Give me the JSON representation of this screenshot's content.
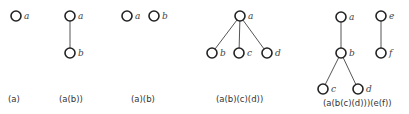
{
  "figure": {
    "node_radius": 5,
    "trees": [
      {
        "id": "t1",
        "caption": "(a)",
        "caption_pos": [
          8,
          102
        ],
        "nodes": [
          {
            "id": "a",
            "label": "a",
            "x": 16,
            "y": 16
          }
        ],
        "edges": []
      },
      {
        "id": "t2",
        "caption": "(a(b))",
        "caption_pos": [
          59,
          102
        ],
        "nodes": [
          {
            "id": "a",
            "label": "a",
            "x": 70,
            "y": 16
          },
          {
            "id": "b",
            "label": "b",
            "x": 70,
            "y": 53
          }
        ],
        "edges": [
          [
            "a",
            "b"
          ]
        ]
      },
      {
        "id": "t3",
        "caption": "(a)(b)",
        "caption_pos": [
          131,
          102
        ],
        "nodes": [
          {
            "id": "a",
            "label": "a",
            "x": 127,
            "y": 16
          },
          {
            "id": "b",
            "label": "b",
            "x": 154,
            "y": 16
          }
        ],
        "edges": []
      },
      {
        "id": "t4",
        "caption": "(a(b)(c)(d))",
        "caption_pos": [
          216,
          102
        ],
        "nodes": [
          {
            "id": "a",
            "label": "a",
            "x": 240,
            "y": 16
          },
          {
            "id": "b",
            "label": "b",
            "x": 212,
            "y": 53
          },
          {
            "id": "c",
            "label": "c",
            "x": 239,
            "y": 53
          },
          {
            "id": "d",
            "label": "d",
            "x": 267,
            "y": 53
          }
        ],
        "edges": [
          [
            "a",
            "b"
          ],
          [
            "a",
            "c"
          ],
          [
            "a",
            "d"
          ]
        ]
      },
      {
        "id": "t5",
        "caption": "(a(b(c)(d)))(e(f))",
        "caption_pos": [
          323,
          106
        ],
        "nodes": [
          {
            "id": "a",
            "label": "a",
            "x": 341,
            "y": 17
          },
          {
            "id": "b",
            "label": "b",
            "x": 341,
            "y": 53
          },
          {
            "id": "c",
            "label": "c",
            "x": 323,
            "y": 89
          },
          {
            "id": "d",
            "label": "d",
            "x": 358,
            "y": 89
          },
          {
            "id": "e",
            "label": "e",
            "x": 381,
            "y": 16
          },
          {
            "id": "f",
            "label": "f",
            "x": 381,
            "y": 53
          }
        ],
        "edges": [
          [
            "a",
            "b"
          ],
          [
            "b",
            "c"
          ],
          [
            "b",
            "d"
          ],
          [
            "e",
            "f"
          ]
        ]
      }
    ]
  }
}
